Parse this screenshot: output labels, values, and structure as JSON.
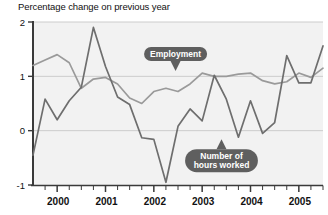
{
  "chart_data": {
    "type": "line",
    "title": "Percentage change on previous year",
    "xlabel": "",
    "ylabel": "",
    "ylim": [
      -1,
      2
    ],
    "xlim": [
      1999.5,
      2005.5
    ],
    "grid": true,
    "gridlines_y": [
      2,
      1,
      0,
      -1
    ],
    "ytick_labels": [
      "2",
      "1",
      "0",
      "-1"
    ],
    "ytick_values": [
      2,
      1,
      0,
      -1
    ],
    "xtick_labels": [
      "2000",
      "2001",
      "2002",
      "2003",
      "2004",
      "2005"
    ],
    "xtick_values": [
      2000,
      2001,
      2002,
      2003,
      2004,
      2005
    ],
    "minor_xticks_per_year": 4,
    "legend_position": "inline-callouts",
    "x": [
      1999.5,
      1999.75,
      2000.0,
      2000.25,
      2000.5,
      2000.75,
      2001.0,
      2001.25,
      2001.5,
      2001.75,
      2002.0,
      2002.25,
      2002.5,
      2002.75,
      2003.0,
      2003.25,
      2003.5,
      2003.75,
      2004.0,
      2004.25,
      2004.5,
      2004.75,
      2005.0,
      2005.25,
      2005.5
    ],
    "series": [
      {
        "name": "Employment",
        "color": "#9a9a9a",
        "values": [
          1.2,
          1.3,
          1.4,
          1.25,
          0.78,
          0.95,
          0.98,
          0.86,
          0.6,
          0.5,
          0.72,
          0.78,
          0.72,
          0.86,
          1.06,
          1.0,
          1.0,
          1.04,
          1.06,
          0.92,
          0.86,
          0.9,
          1.06,
          0.98,
          1.15
        ]
      },
      {
        "name": "Number of hours worked",
        "color": "#6e6e6e",
        "values": [
          -0.45,
          0.58,
          0.2,
          0.55,
          0.8,
          1.9,
          1.18,
          0.62,
          0.48,
          -0.13,
          -0.16,
          -0.95,
          0.08,
          0.4,
          0.18,
          1.02,
          0.58,
          -0.12,
          0.55,
          -0.05,
          0.15,
          1.38,
          0.88,
          0.88,
          1.56
        ]
      }
    ],
    "annotations": [
      {
        "name": "employment-callout",
        "text": "Employment",
        "anchor_x": 2002.45,
        "anchor_y": 1.06,
        "fill": "#5f5f5f",
        "text_color": "#ffffff",
        "tail": "down"
      },
      {
        "name": "hours-worked-callout",
        "line1": "Number of",
        "line2": "hours worked",
        "anchor_x": 2003.4,
        "anchor_y": -0.12,
        "fill": "#5f5f5f",
        "text_color": "#ffffff",
        "tail": "up"
      }
    ],
    "colors": {
      "plot_background": "#f2f2f2",
      "page_background": "#ffffff",
      "axis": "#3a3a3a",
      "gridline": "#cccccc",
      "employment_line": "#9a9a9a",
      "hours_line": "#6e6e6e",
      "callout_fill": "#5f5f5f",
      "text": "#111111"
    }
  }
}
